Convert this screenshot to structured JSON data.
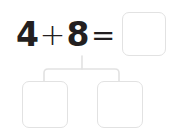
{
  "worksheet": {
    "type": "number-bond-decomposition",
    "background_color": "#ffffff",
    "equation": {
      "first_addend": "4",
      "operator_add": "+",
      "second_addend": "8",
      "operator_equals": "=",
      "sum_value": "",
      "sum_placeholder": ""
    },
    "parts": [
      {
        "label": "left-part",
        "value": "",
        "placeholder": ""
      },
      {
        "label": "right-part",
        "value": "",
        "placeholder": ""
      }
    ],
    "colors": {
      "text": "#231f20",
      "box_border": "#e2e2e2",
      "connector_line": "#e2e2e2",
      "box_fill": "#ffffff"
    },
    "connector": {
      "shape": "bracket-tree",
      "stem_x": 82,
      "stem_top_y": 57,
      "bar_y": 69,
      "left_arm_x": 44,
      "right_arm_x": 119,
      "arm_bottom_y": 81
    }
  }
}
